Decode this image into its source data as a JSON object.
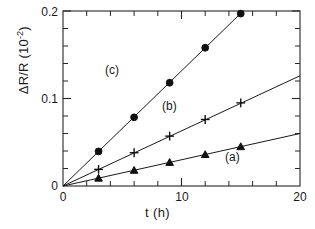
{
  "chart_data": {
    "type": "line",
    "title": "",
    "xlabel": "t (h)",
    "ylabel": "ΔR/R  (10",
    "ylabel_exp": "-2",
    "ylabel_close": ")",
    "xlim": [
      0,
      20
    ],
    "ylim": [
      0,
      0.2
    ],
    "grid": false,
    "legend_position": "inline-annotations",
    "x_ticks_major": [
      0,
      10,
      20
    ],
    "x_tick_labels": [
      "0",
      "10",
      "20"
    ],
    "x_ticks_minor": [
      2,
      4,
      6,
      8,
      12,
      14,
      16,
      18
    ],
    "y_ticks_major": [
      0.1,
      0.2
    ],
    "y_tick_labels": [
      "0.1",
      "0.2"
    ],
    "y_ticks_minor": [
      0.02,
      0.04,
      0.06,
      0.08,
      0.12,
      0.14,
      0.16,
      0.18
    ],
    "origin_label": "0",
    "series": [
      {
        "name": "(a)",
        "marker": "triangle",
        "slope": 0.003,
        "x": [
          3,
          6,
          9,
          12,
          15
        ],
        "values": [
          0.009,
          0.018,
          0.027,
          0.036,
          0.045
        ],
        "line_x": [
          0,
          20
        ],
        "line_y": [
          0,
          0.06
        ],
        "label_x": 16.2,
        "label_y": 0.03
      },
      {
        "name": "(b)",
        "marker": "plus",
        "slope": 0.0063,
        "x": [
          3,
          6,
          9,
          12,
          15
        ],
        "values": [
          0.019,
          0.038,
          0.057,
          0.076,
          0.095
        ],
        "line_x": [
          0,
          20
        ],
        "line_y": [
          0,
          0.126
        ],
        "label_x": 12.3,
        "label_y": 0.08
      },
      {
        "name": "(c)",
        "marker": "circle",
        "slope": 0.0131,
        "x": [
          3,
          6,
          9,
          12,
          15
        ],
        "values": [
          0.0395,
          0.0785,
          0.118,
          0.158,
          0.197
        ],
        "line_x": [
          0,
          15.2
        ],
        "line_y": [
          0,
          0.2
        ],
        "label_x": 6.0,
        "label_y": 0.152
      }
    ]
  }
}
